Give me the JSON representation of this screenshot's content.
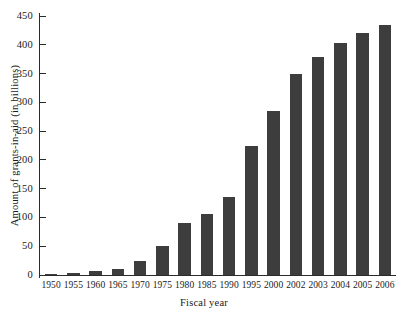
{
  "chart_data": {
    "type": "bar",
    "title": "",
    "xlabel": "Fiscal year",
    "ylabel": "Amount of grants-in-aid (in billions)",
    "categories": [
      "1950",
      "1955",
      "1960",
      "1965",
      "1970",
      "1975",
      "1980",
      "1985",
      "1990",
      "1995",
      "2000",
      "2002",
      "2003",
      "2004",
      "2005",
      "2006"
    ],
    "values": [
      2,
      3,
      7,
      11,
      24,
      50,
      91,
      106,
      135,
      225,
      285,
      350,
      378,
      403,
      420,
      434
    ],
    "ylim": [
      0,
      450
    ],
    "yticks": [
      0,
      50,
      100,
      150,
      200,
      250,
      300,
      350,
      400,
      450
    ],
    "ytick_labels": [
      "0",
      "50",
      "100",
      "150",
      "200",
      "250",
      "300",
      "350",
      "400",
      "450"
    ],
    "grid": false,
    "legend": false,
    "bar_color": "#3d3d3d",
    "axis_color": "#2b2b2b",
    "background": "#ffffff"
  }
}
